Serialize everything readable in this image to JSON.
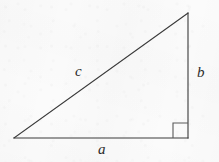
{
  "figure": {
    "name": "right-triangle",
    "caption": "",
    "background_color": "#fbfbfb",
    "stroke_color": "#3a3a3a",
    "stroke_width": 1.1,
    "width": 219,
    "height": 162
  },
  "chart_data": {
    "type": "diagram",
    "title": "",
    "subtitle": "",
    "xlabel": "",
    "ylabel": "",
    "grid": false,
    "legend": null,
    "shape": "right-triangle",
    "vertices": [
      {
        "id": "A",
        "label": "",
        "x": 14,
        "y": 138
      },
      {
        "id": "B",
        "label": "",
        "x": 188,
        "y": 138
      },
      {
        "id": "C",
        "label": "",
        "x": 188,
        "y": 13
      }
    ],
    "edges": [
      {
        "id": "a",
        "label": "a",
        "from": "A",
        "to": "B",
        "role": "base-leg",
        "x1": 14,
        "y1": 138,
        "x2": 188,
        "y2": 138
      },
      {
        "id": "b",
        "label": "b",
        "from": "B",
        "to": "C",
        "role": "vertical-leg",
        "x1": 188,
        "y1": 138,
        "x2": 188,
        "y2": 13
      },
      {
        "id": "c",
        "label": "c",
        "from": "A",
        "to": "C",
        "role": "hypotenuse",
        "x1": 14,
        "y1": 138,
        "x2": 188,
        "y2": 13
      }
    ],
    "right_angle_marker": {
      "at_vertex": "B",
      "x": 173,
      "y": 123,
      "size": 15
    }
  },
  "labels": {
    "side_a": "a",
    "side_b": "b",
    "side_c": "c"
  }
}
